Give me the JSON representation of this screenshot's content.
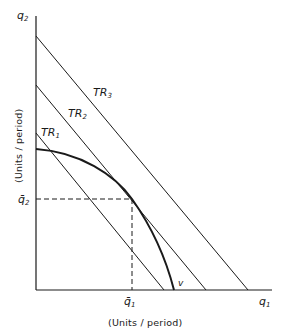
{
  "diagram": {
    "type": "production-possibility frontier with isorevenue lines",
    "axes": {
      "y": {
        "label": "q",
        "sub": "2",
        "title": "(Units / period)"
      },
      "x": {
        "label": "q",
        "sub": "1",
        "title": "(Units / period)"
      }
    },
    "lines": [
      {
        "name": "TR",
        "sub": "1"
      },
      {
        "name": "TR",
        "sub": "2"
      },
      {
        "name": "TR",
        "sub": "3"
      }
    ],
    "curve": {
      "label": "v"
    },
    "equilibrium": {
      "q1": {
        "label": "q̄",
        "sub": "1"
      },
      "q2": {
        "label": "q̄",
        "sub": "2"
      }
    },
    "colors": {
      "ink": "#1a1a1a",
      "background": "#ffffff"
    }
  }
}
